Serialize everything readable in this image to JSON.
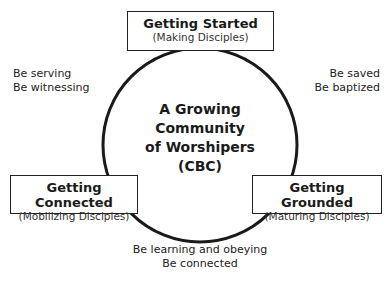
{
  "diagram": {
    "center": {
      "line1": "A Growing Community",
      "line2": "of Worshipers",
      "line3": "(CBC)"
    },
    "stages": [
      {
        "title": "Getting Started",
        "subtitle": "(Making Disciples)",
        "position": "top"
      },
      {
        "title": "Getting Grounded",
        "subtitle": "(Maturing Disciples)",
        "position": "right"
      },
      {
        "title": "Getting Connected",
        "subtitle": "(Mobilizing Disciples)",
        "position": "left"
      }
    ],
    "notes": {
      "top_left": [
        "Be serving",
        "Be witnessing"
      ],
      "top_right": [
        "Be saved",
        "Be baptized"
      ],
      "bottom": [
        "Be learning and obeying",
        "Be connected"
      ]
    },
    "colors": {
      "line": "#1a1a1a",
      "text": "#222222",
      "background": "#ffffff"
    }
  }
}
